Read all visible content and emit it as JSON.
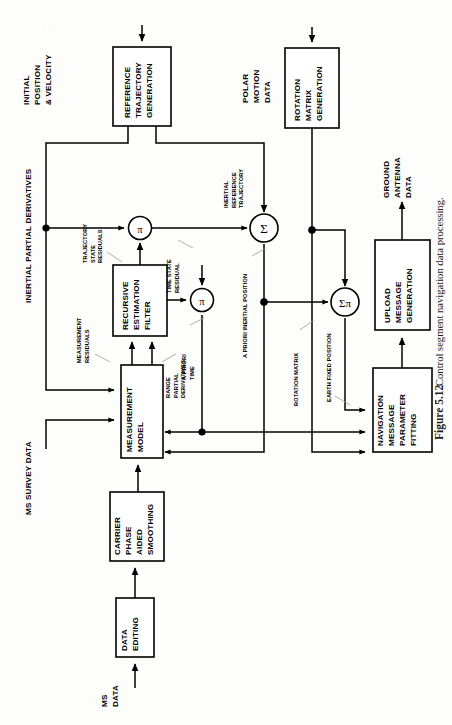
{
  "figure": {
    "number": "Figure 5.12",
    "caption": "Control segment navigation data processing.",
    "orientation": "rotated-90-ccw"
  },
  "blocks": [
    {
      "id": "reference-trajectory-generation",
      "lines": [
        "REFERENCE",
        "TRAJECTORY",
        "GENERATION"
      ]
    },
    {
      "id": "rotation-matrix-generation",
      "lines": [
        "ROTATION",
        "MATRIX",
        "GENERATION"
      ]
    },
    {
      "id": "recursive-estimation-filter",
      "lines": [
        "RECURSIVE",
        "ESTIMATION",
        "FILTER"
      ]
    },
    {
      "id": "measurement-model",
      "lines": [
        "MEASUREMENT",
        "MODEL"
      ]
    },
    {
      "id": "carrier-phase-aided-smoothing",
      "lines": [
        "CARRIER",
        "PHASE",
        "AIDED",
        "SMOOTHING"
      ]
    },
    {
      "id": "data-editing",
      "lines": [
        "DATA",
        "EDITING"
      ]
    },
    {
      "id": "upload-message-generation",
      "lines": [
        "UPLOAD",
        "MESSAGE",
        "GENERATION"
      ]
    },
    {
      "id": "navigation-message-parameter-fitting",
      "lines": [
        "NAVIGATION",
        "MESSAGE",
        "PARAMETER",
        "FITTING"
      ]
    }
  ],
  "operators": [
    {
      "id": "pi-trajectory",
      "glyph": "π"
    },
    {
      "id": "pi-time",
      "glyph": "π"
    },
    {
      "id": "sigma-inertial",
      "glyph": "Σ"
    },
    {
      "id": "sigma-pi-earth-fixed",
      "glyph": "Σπ"
    }
  ],
  "io_labels": {
    "initial_position_velocity": [
      "INITIAL",
      "POSITION",
      "& VELOCITY"
    ],
    "polar_motion_data": [
      "POLAR",
      "MOTION",
      "DATA"
    ],
    "inertial_partial_derivatives": [
      "INERTIAL PARTIAL DERIVATIVES"
    ],
    "ms_survey_data": [
      "MS SURVEY DATA"
    ],
    "ms_data": [
      "MS",
      "DATA"
    ],
    "ground_antenna_data": [
      "GROUND",
      "ANTENNA",
      "DATA"
    ]
  },
  "signal_labels": {
    "trajectory_state_residuals": [
      "TRAJECTORY",
      "STATE",
      "RESIDUALS"
    ],
    "measurement_residuals": [
      "MEASUREMENT",
      "RESIDUALS"
    ],
    "range_partial_derivatives": [
      "RANGE",
      "PARTIAL",
      "DERIVATIVES"
    ],
    "time_state_residual": [
      "TIME STATE",
      "RESIDUAL"
    ],
    "a_priori_time": [
      "A PRIORI",
      "TIME"
    ],
    "inertial_reference_trajectory": [
      "INERTIAL",
      "REFERENCE",
      "TRAJECTORY"
    ],
    "a_priori_inertial_position": [
      "A PRIORI INERTIAL POSITION"
    ],
    "rotation_matrix": [
      "ROTATION MATRIX"
    ],
    "earth_fixed_position": [
      "EARTH FIXED POSITION"
    ]
  },
  "colors": {
    "ink": "#000000",
    "paper": "#fdfdfb",
    "leader": "#9a9a9a",
    "caption": "#1b1b1b"
  }
}
